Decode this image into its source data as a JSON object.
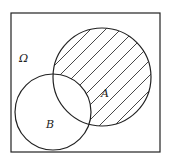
{
  "diagram": {
    "type": "venn",
    "universe_label": "Ω",
    "set_a_label": "A",
    "set_b_label": "B",
    "shaded_region": "A minus B (A ∩ complement of B)",
    "colors": {
      "stroke": "#222222",
      "background": "#ffffff"
    }
  }
}
